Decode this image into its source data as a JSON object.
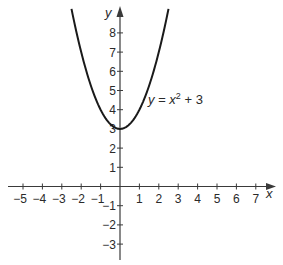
{
  "chart_data": {
    "type": "line",
    "title": "",
    "xlabel": "x",
    "ylabel": "y",
    "xlim": [
      -5.5,
      7.6
    ],
    "ylim": [
      -3.6,
      9.3
    ],
    "grid": false,
    "x_ticks": [
      -5,
      -4,
      -3,
      -2,
      -1,
      1,
      2,
      3,
      4,
      5,
      6,
      7
    ],
    "y_ticks": [
      -3,
      -2,
      -1,
      1,
      2,
      3,
      4,
      5,
      6,
      7,
      8
    ],
    "series": [
      {
        "name": "y = x² + 3",
        "equation": "y = x^2 + 3",
        "x": [
          -2.5,
          -2,
          -1.5,
          -1,
          -0.5,
          0,
          0.5,
          1,
          1.5,
          2,
          2.5
        ],
        "values": [
          9.25,
          7,
          5.25,
          4,
          3.25,
          3,
          3.25,
          4,
          5.25,
          7,
          9.25
        ]
      }
    ],
    "annotations": [
      {
        "text_main": "y = x",
        "superscript": "2",
        "text_tail": " + 3",
        "at": [
          1.3,
          4.6
        ]
      }
    ]
  },
  "labels": {
    "x_axis": "x",
    "y_axis": "y",
    "equation_main": "y = x",
    "equation_sup": "2",
    "equation_tail": " + 3"
  },
  "colors": {
    "axis": "#3a3a3a",
    "curve": "#1a1a1a",
    "text": "#2a2a2a"
  }
}
